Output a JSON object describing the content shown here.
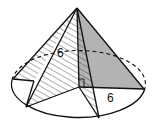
{
  "figure": {
    "labels": {
      "slant_label": "6",
      "radius_label": "6"
    },
    "colors": {
      "stroke": "#111111",
      "shade": "#b3b3b3",
      "hatch": "#333333",
      "background": "#ffffff"
    }
  }
}
